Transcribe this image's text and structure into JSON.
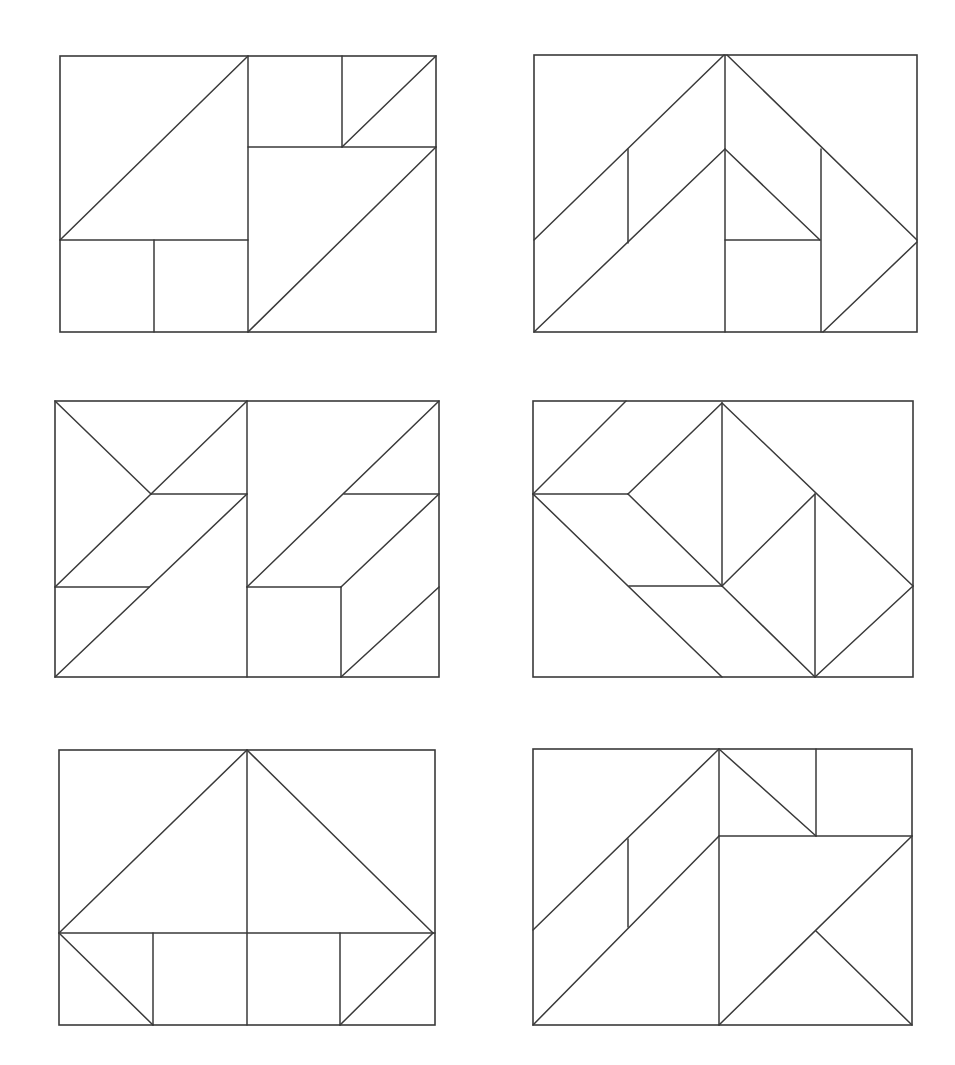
{
  "style": {
    "stroke": "#3a3a3a",
    "background": "#ffffff"
  },
  "panels": [
    {
      "name": "puzzle-1",
      "frame": [
        60,
        56,
        436,
        332
      ],
      "lines": [
        [
          248,
          56,
          248,
          332
        ],
        [
          60,
          240,
          248,
          56
        ],
        [
          60,
          240,
          248,
          240
        ],
        [
          154,
          240,
          154,
          332
        ],
        [
          248,
          147,
          436,
          147
        ],
        [
          342,
          56,
          342,
          147
        ],
        [
          342,
          147,
          436,
          56
        ],
        [
          248,
          332,
          436,
          147
        ]
      ]
    },
    {
      "name": "puzzle-2",
      "frame": [
        534,
        55,
        917,
        332
      ],
      "lines": [
        [
          534,
          240,
          724,
          55
        ],
        [
          628,
          149,
          628,
          243
        ],
        [
          534,
          332,
          725,
          149
        ],
        [
          725,
          55,
          725,
          332
        ],
        [
          725,
          149,
          820,
          240
        ],
        [
          725,
          240,
          820,
          240
        ],
        [
          821,
          149,
          821,
          332
        ],
        [
          727,
          55,
          917,
          240
        ],
        [
          823,
          332,
          917,
          242
        ]
      ]
    },
    {
      "name": "puzzle-3",
      "frame": [
        55,
        401,
        439,
        677
      ],
      "lines": [
        [
          247,
          401,
          247,
          677
        ],
        [
          55,
          401,
          151,
          494
        ],
        [
          151,
          494,
          247,
          401
        ],
        [
          151,
          494,
          247,
          494
        ],
        [
          55,
          587,
          151,
          494
        ],
        [
          55,
          587,
          149,
          587
        ],
        [
          55,
          677,
          247,
          494
        ],
        [
          247,
          587,
          439,
          401
        ],
        [
          344,
          494,
          439,
          494
        ],
        [
          341,
          587,
          439,
          494
        ],
        [
          247,
          587,
          341,
          587
        ],
        [
          341,
          587,
          341,
          677
        ],
        [
          341,
          677,
          439,
          587
        ]
      ]
    },
    {
      "name": "puzzle-4",
      "frame": [
        533,
        401,
        913,
        677
      ],
      "lines": [
        [
          533,
          494,
          626,
          401
        ],
        [
          533,
          494,
          628,
          494
        ],
        [
          628,
          494,
          722,
          403
        ],
        [
          722,
          403,
          722,
          586
        ],
        [
          628,
          494,
          722,
          586
        ],
        [
          533,
          494,
          722,
          677
        ],
        [
          629,
          586,
          722,
          586
        ],
        [
          722,
          586,
          815,
          677
        ],
        [
          722,
          586,
          815,
          494
        ],
        [
          815,
          494,
          815,
          677
        ],
        [
          722,
          403,
          913,
          586
        ],
        [
          815,
          677,
          913,
          586
        ]
      ]
    },
    {
      "name": "puzzle-5",
      "frame": [
        59,
        750,
        435,
        1025
      ],
      "lines": [
        [
          247,
          750,
          247,
          1025
        ],
        [
          59,
          933,
          247,
          750
        ],
        [
          247,
          750,
          433,
          933
        ],
        [
          59,
          933,
          435,
          933
        ],
        [
          59,
          933,
          153,
          1025
        ],
        [
          153,
          933,
          153,
          1025
        ],
        [
          340,
          933,
          340,
          1025
        ],
        [
          340,
          1025,
          433,
          933
        ]
      ]
    },
    {
      "name": "puzzle-6",
      "frame": [
        533,
        749,
        912,
        1025
      ],
      "lines": [
        [
          533,
          930,
          719,
          749
        ],
        [
          628,
          839,
          628,
          927
        ],
        [
          533,
          1025,
          719,
          836
        ],
        [
          719,
          749,
          719,
          1025
        ],
        [
          719,
          749,
          816,
          836
        ],
        [
          816,
          749,
          816,
          836
        ],
        [
          719,
          836,
          912,
          836
        ],
        [
          719,
          1025,
          912,
          836
        ],
        [
          816,
          931,
          912,
          1025
        ]
      ]
    }
  ]
}
